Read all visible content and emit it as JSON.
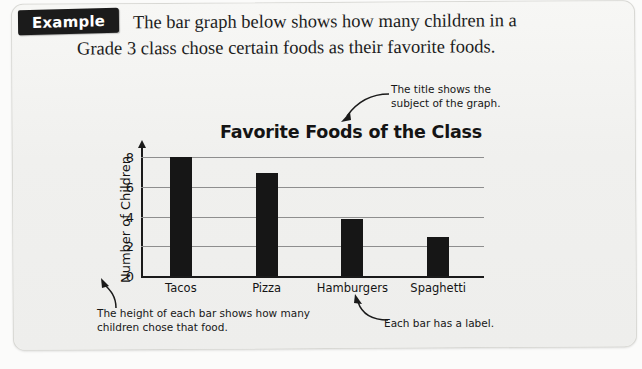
{
  "badge": {
    "label": "Example"
  },
  "intro": {
    "line1": "The bar graph below shows how many children in a",
    "line2": "Grade 3 class chose certain foods as their favorite foods."
  },
  "annotations": {
    "title_note": "The title shows the subject of the graph.",
    "height_note": "The height of each bar shows how many children chose that food.",
    "label_note": "Each bar has a label."
  },
  "chart_data": {
    "type": "bar",
    "title": "Favorite Foods of the Class",
    "xlabel": "",
    "ylabel": "Number of Children",
    "categories": [
      "Tacos",
      "Pizza",
      "Hamburgers",
      "Spaghetti"
    ],
    "values": [
      8,
      6.9,
      3.8,
      2.6
    ],
    "yticks": [
      0,
      2,
      4,
      6,
      8
    ],
    "ylim": [
      0,
      8
    ],
    "grid": true,
    "legend": false,
    "bar_color": "#161616"
  }
}
